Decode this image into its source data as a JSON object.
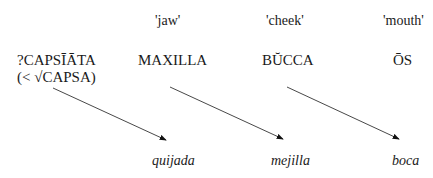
{
  "glosses": [
    "'jaw'",
    "'cheek'",
    "'mouth'"
  ],
  "latin": {
    "capsiata": "?CAPSĪĀTA",
    "capsiata_root": "(< √CAPSA)",
    "maxilla": "MAXILLA",
    "bucca": "BŬCCA",
    "os": "ŌS"
  },
  "spanish": [
    "quijada",
    "mejilla",
    "boca"
  ],
  "arrows": [
    {
      "from": "?CAPSĪĀTA",
      "to": "quijada"
    },
    {
      "from": "MAXILLA",
      "to": "mejilla"
    },
    {
      "from": "BŬCCA",
      "to": "boca"
    }
  ]
}
